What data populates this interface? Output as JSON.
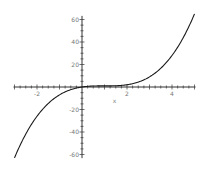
{
  "chart_data": {
    "type": "line",
    "title": "",
    "xlabel": "x",
    "ylabel": "",
    "xlim": [
      -3,
      5
    ],
    "ylim": [
      -65,
      65
    ],
    "grid": false,
    "legend": null,
    "x_ticks": [
      -2,
      2,
      4
    ],
    "x_tick_labels": [
      "-2",
      "2",
      "4"
    ],
    "y_ticks": [
      -60,
      -40,
      -20,
      20,
      40,
      60
    ],
    "y_tick_labels": [
      "-60",
      "-40",
      "-20",
      "20",
      "40",
      "60"
    ],
    "series": [
      {
        "name": "f(x)",
        "color": "#1a1a1a",
        "x": [
          -3,
          -2.5,
          -2,
          -1.5,
          -1,
          -0.5,
          0,
          0.5,
          1,
          1.5,
          2,
          2.5,
          3,
          3.5,
          4,
          4.5,
          5
        ],
        "y": [
          -63,
          -41.875,
          -26,
          -14.625,
          -7,
          -2.375,
          0,
          0.875,
          1,
          1.125,
          2,
          4.375,
          9,
          16.625,
          28,
          43.875,
          65
        ]
      }
    ]
  },
  "colors": {
    "axis": "#333333",
    "curve": "#1a1a1a",
    "background": "#ffffff"
  }
}
